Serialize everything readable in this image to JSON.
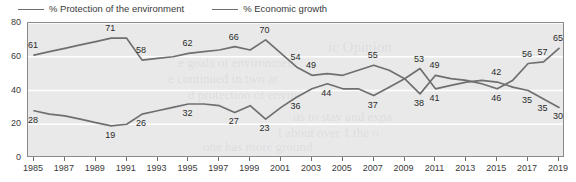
{
  "chart_data": {
    "type": "line",
    "title": "",
    "subtitle": "",
    "xlabel": "",
    "ylabel": "",
    "ylim": [
      0,
      80
    ],
    "yticks": [
      0,
      20,
      40,
      60,
      80
    ],
    "grid": "horizontal",
    "legend_position": "top-left",
    "x": [
      1985,
      1986,
      1987,
      1988,
      1989,
      1990,
      1991,
      1992,
      1993,
      1994,
      1995,
      1996,
      1997,
      1998,
      1999,
      2000,
      2001,
      2002,
      2003,
      2004,
      2005,
      2006,
      2007,
      2008,
      2009,
      2010,
      2011,
      2012,
      2013,
      2014,
      2015,
      2016,
      2017,
      2018,
      2019
    ],
    "xticks": [
      1985,
      1987,
      1989,
      1991,
      1993,
      1995,
      1997,
      1999,
      2001,
      2003,
      2005,
      2007,
      2009,
      2011,
      2013,
      2015,
      2017,
      2019
    ],
    "xtick_labels": [
      "1985",
      "1987",
      "1989",
      "1991",
      "1993",
      "1995",
      "1997",
      "1999",
      "2001",
      "2003",
      "2005",
      "2007",
      "2009",
      "2011",
      "2013",
      "2015",
      "2017",
      "2019"
    ],
    "series": [
      {
        "name": "% Protection of the environment",
        "color": "#6f6f6f",
        "values": [
          61,
          63,
          65,
          67,
          69,
          71,
          71,
          58,
          59,
          60,
          62,
          63,
          64,
          66,
          64,
          70,
          62,
          54,
          49,
          50,
          49,
          52,
          55,
          52,
          47,
          38,
          49,
          47,
          46,
          44,
          41,
          46,
          56,
          57,
          65
        ],
        "labels": [
          {
            "x": 1985,
            "value": 61
          },
          {
            "x": 1990,
            "value": 71
          },
          {
            "x": 1992,
            "value": 58
          },
          {
            "x": 1995,
            "value": 62
          },
          {
            "x": 1998,
            "value": 66
          },
          {
            "x": 2000,
            "value": 70
          },
          {
            "x": 2002,
            "value": 54
          },
          {
            "x": 2003,
            "value": 49
          },
          {
            "x": 2007,
            "value": 55
          },
          {
            "x": 2010,
            "value": 38
          },
          {
            "x": 2011,
            "value": 49
          },
          {
            "x": 2015,
            "value": 46
          },
          {
            "x": 2017,
            "value": 56
          },
          {
            "x": 2018,
            "value": 57
          },
          {
            "x": 2019,
            "value": 65
          }
        ]
      },
      {
        "name": "% Economic growth",
        "color": "#6f6f6f",
        "values": [
          28,
          26,
          25,
          23,
          21,
          19,
          20,
          26,
          28,
          30,
          32,
          32,
          31,
          27,
          31,
          23,
          30,
          36,
          41,
          44,
          41,
          41,
          37,
          42,
          47,
          53,
          41,
          43,
          45,
          46,
          45,
          42,
          40,
          35,
          30
        ],
        "labels": [
          {
            "x": 1985,
            "value": 28
          },
          {
            "x": 1990,
            "value": 19
          },
          {
            "x": 1992,
            "value": 26
          },
          {
            "x": 1995,
            "value": 32
          },
          {
            "x": 1998,
            "value": 27
          },
          {
            "x": 2000,
            "value": 23
          },
          {
            "x": 2002,
            "value": 36
          },
          {
            "x": 2004,
            "value": 44
          },
          {
            "x": 2007,
            "value": 37
          },
          {
            "x": 2010,
            "value": 53
          },
          {
            "x": 2011,
            "value": 41
          },
          {
            "x": 2015,
            "value": 42
          },
          {
            "x": 2017,
            "value": 35
          },
          {
            "x": 2018,
            "value": 35
          },
          {
            "x": 2019,
            "value": 30
          }
        ]
      }
    ]
  },
  "legend": {
    "entries": [
      {
        "label": "% Protection of the environment"
      },
      {
        "label": "% Economic growth"
      }
    ]
  },
  "bleed_text": {
    "line1": "e goals of environmen",
    "line2": "e continued in two ar",
    "line3": "d protection of enviro",
    "line4": "ic Opinion",
    "line5": "us to stay and expa",
    "line6": "l about over 1 the o",
    "line7": "one has more ground"
  }
}
